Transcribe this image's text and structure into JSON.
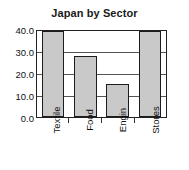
{
  "chart_data": {
    "type": "bar",
    "title": "Japan by Sector",
    "xlabel": "",
    "ylabel": "",
    "categories": [
      "Textile",
      "Food",
      "Engin",
      "Stores"
    ],
    "values": [
      40.0,
      28.5,
      15.2,
      40.0
    ],
    "ylim": [
      0.0,
      40.0
    ],
    "ytick_labels": [
      "40.0",
      "30.0",
      "20.0",
      "10.0",
      "0.0"
    ],
    "ytick_values": [
      40.0,
      30.0,
      20.0,
      10.0,
      0.0
    ],
    "grid": true,
    "legend": false,
    "legend_position": "none",
    "bar_fill_color": "#c9c9c9",
    "bar_edge_color": "#1c1c1c",
    "axis_color": "#222222",
    "gridline_color": "#555555",
    "background_color": "#ffffff",
    "xlabel_rotation": 90
  }
}
